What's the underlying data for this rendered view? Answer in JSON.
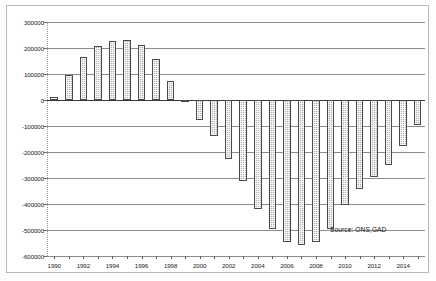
{
  "chart_data": {
    "type": "bar",
    "title": "",
    "subtitle": "",
    "xlabel": "",
    "ylabel": "",
    "ylim": [
      -600000,
      300000
    ],
    "ytick_values": [
      300000,
      200000,
      100000,
      0,
      -100000,
      -200000,
      -300000,
      -400000,
      -500000,
      -600000
    ],
    "ytick_labels": [
      "300000",
      "200000",
      "100000",
      "0",
      "-100000",
      "-200000",
      "-300000",
      "-400000",
      "-500000",
      "-600000"
    ],
    "xtick_labels": [
      "1990",
      "1992",
      "1994",
      "1996",
      "1998",
      "2000",
      "2002",
      "2004",
      "2006",
      "2008",
      "2010",
      "2012",
      "2014"
    ],
    "grid": true,
    "legend": null,
    "categories": [
      "1990",
      "1991",
      "1992",
      "1993",
      "1994",
      "1995",
      "1996",
      "1997",
      "1998",
      "1999",
      "2000",
      "2001",
      "2002",
      "2003",
      "2004",
      "2005",
      "2006",
      "2007",
      "2008",
      "2009",
      "2010",
      "2011",
      "2012",
      "2013",
      "2014",
      "2015"
    ],
    "values": [
      10000,
      98000,
      165000,
      207000,
      227000,
      230000,
      212000,
      158000,
      75000,
      -3000,
      -75000,
      -140000,
      -225000,
      -312000,
      -418000,
      -498000,
      -545000,
      -558000,
      -548000,
      -498000,
      -405000,
      -342000,
      -295000,
      -250000,
      -178000,
      -95000
    ],
    "annotations": [
      {
        "name": "source",
        "text": "Source:  ONS,GAD"
      }
    ],
    "colors": {
      "bar_fill": "#b4b4b4",
      "bar_edge": "#4a4a4a",
      "gridline": "#8d8d8d",
      "axis": "#3a3a3a",
      "text": "#1a1a1a",
      "background": "#ffffff"
    }
  }
}
